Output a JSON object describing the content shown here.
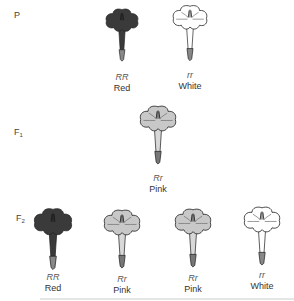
{
  "diagram": {
    "colors": {
      "red": "#3a3a3a",
      "pink": "#c8c8c8",
      "white": "#ffffff",
      "outline": "#222222"
    },
    "generations": [
      {
        "id": "P",
        "label": "P",
        "sub": "",
        "flowers": [
          {
            "genotype": "RR",
            "phenotype": "Red",
            "color": "red"
          },
          {
            "genotype": "rr",
            "phenotype": "White",
            "color": "white"
          }
        ]
      },
      {
        "id": "F1",
        "label": "F",
        "sub": "1",
        "flowers": [
          {
            "genotype": "Rr",
            "phenotype": "Pink",
            "color": "pink"
          }
        ]
      },
      {
        "id": "F2",
        "label": "F",
        "sub": "2",
        "flowers": [
          {
            "genotype": "RR",
            "phenotype": "Red",
            "color": "red"
          },
          {
            "genotype": "Rr",
            "phenotype": "Pink",
            "color": "pink"
          },
          {
            "genotype": "Rr",
            "phenotype": "Pink",
            "color": "pink"
          },
          {
            "genotype": "rr",
            "phenotype": "White",
            "color": "white"
          }
        ]
      }
    ]
  }
}
